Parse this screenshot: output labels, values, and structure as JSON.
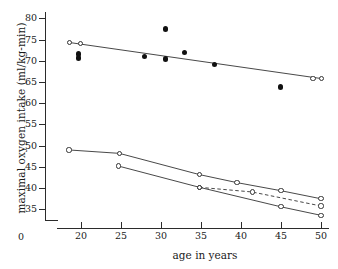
{
  "chart_data": {
    "type": "line",
    "title": "",
    "xlabel": "age in years",
    "ylabel": "maximal oxygen intake (ml/kg-min)",
    "xlim": [
      17.0,
      51.0
    ],
    "ylim": [
      32.5,
      81.5
    ],
    "xticks": [
      20,
      25,
      30,
      35,
      40,
      45,
      50
    ],
    "yticks": [
      35,
      40,
      45,
      50,
      55,
      60,
      65,
      70,
      75,
      80
    ],
    "origin_label": "0",
    "axis_break": true,
    "grid": false,
    "legend": "none",
    "series": [
      {
        "name": "elite athletes regression line",
        "style": "solid-line",
        "marker": "open-circle",
        "points": [
          {
            "x": 18.6,
            "y": 74.3
          },
          {
            "x": 19.9,
            "y": 74.0
          },
          {
            "x": 49.0,
            "y": 65.8
          },
          {
            "x": 50.1,
            "y": 65.8
          }
        ],
        "line_endpoints": [
          {
            "x": 18.6,
            "y": 74.3
          },
          {
            "x": 50.1,
            "y": 65.8
          }
        ]
      },
      {
        "name": "individual athlete measurements",
        "style": "scatter-only",
        "marker": "filled-circle",
        "points": [
          {
            "x": 19.7,
            "y": 71.6
          },
          {
            "x": 19.7,
            "y": 70.7
          },
          {
            "x": 27.9,
            "y": 71.0
          },
          {
            "x": 30.6,
            "y": 77.5
          },
          {
            "x": 30.6,
            "y": 70.4
          },
          {
            "x": 32.9,
            "y": 72.0
          },
          {
            "x": 36.7,
            "y": 69.2
          },
          {
            "x": 44.9,
            "y": 63.8
          }
        ]
      },
      {
        "name": "active men",
        "style": "solid-line",
        "marker": "open-circle",
        "points": [
          {
            "x": 18.5,
            "y": 49.0
          },
          {
            "x": 24.8,
            "y": 48.2
          },
          {
            "x": 34.8,
            "y": 43.2
          },
          {
            "x": 39.5,
            "y": 41.3
          },
          {
            "x": 45.0,
            "y": 39.4
          },
          {
            "x": 50.0,
            "y": 37.5
          }
        ]
      },
      {
        "name": "sedentary men",
        "style": "solid-line",
        "marker": "open-circle",
        "points": [
          {
            "x": 24.7,
            "y": 45.2
          },
          {
            "x": 34.8,
            "y": 40.2
          },
          {
            "x": 45.0,
            "y": 35.6
          },
          {
            "x": 50.0,
            "y": 33.6
          }
        ]
      },
      {
        "name": "intermediate group",
        "style": "dashed-line",
        "marker": "open-circle",
        "points": [
          {
            "x": 34.8,
            "y": 40.2
          },
          {
            "x": 41.4,
            "y": 39.1
          },
          {
            "x": 50.0,
            "y": 35.8
          }
        ]
      }
    ]
  }
}
